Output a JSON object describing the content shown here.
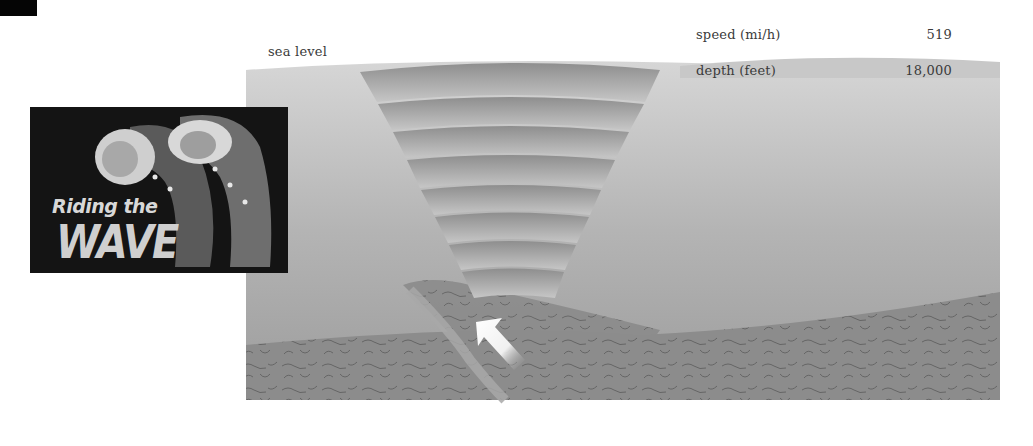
{
  "diagram": {
    "title": "Riding the WAVE",
    "logo": {
      "line1": "Riding the",
      "line2": "WAVE"
    },
    "labels": {
      "sea_level": "sea level"
    },
    "stats": [
      {
        "label": "speed (mi/h)",
        "value": "519"
      },
      {
        "label": "depth (feet)",
        "value": "18,000"
      }
    ],
    "icons": {
      "arrow": "arrow-up-left-icon"
    },
    "colors": {
      "ocean_top": "#d4d4d4",
      "ocean_bottom": "#9a9a9a",
      "seafloor": "#8a8a8a",
      "wave_band": "#b8b8b8",
      "logo_bg": "#141414"
    }
  }
}
